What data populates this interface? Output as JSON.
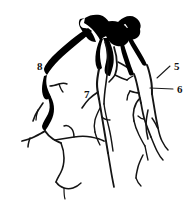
{
  "figure": {
    "kind": "coronary-angiogram-line-drawing",
    "background_color": "#ffffff",
    "ink_color": "#000000",
    "width": 194,
    "height": 206,
    "caption": ""
  },
  "labels": [
    {
      "id": "label-5",
      "text": "5",
      "x": 174,
      "y": 70,
      "leader": {
        "x1": 157,
        "y1": 78,
        "x2": 170,
        "y2": 66
      }
    },
    {
      "id": "label-6",
      "text": "6",
      "x": 177,
      "y": 93,
      "leader": {
        "x1": 150,
        "y1": 88,
        "x2": 173,
        "y2": 89
      }
    },
    {
      "id": "label-7",
      "text": "7",
      "x": 84,
      "y": 98,
      "leader": null
    },
    {
      "id": "label-8",
      "text": "8",
      "x": 37,
      "y": 70,
      "leader": null
    }
  ],
  "structures": {
    "trunk": "thick dark arterial trunk at top center",
    "left_branch": "branch 8 descending along the left margin",
    "center_branch": "branch 7 descending through the middle",
    "right_branches": "branches 5 and 6 on the right side"
  }
}
